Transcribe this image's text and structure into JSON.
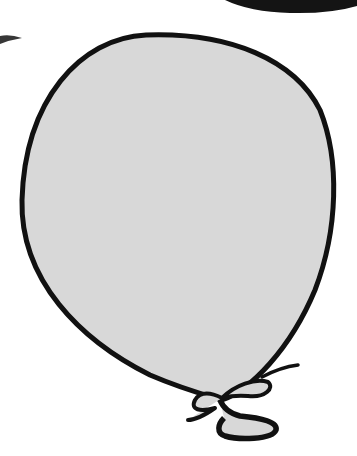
{
  "image": {
    "subject": "balloon",
    "description": "Gray party balloon clipart with black outline and tied knot/bow at bottom",
    "colors": {
      "background": "#ffffff",
      "balloon_fill": "#d8d8d8",
      "outline": "#111111",
      "top_shape": "#141414"
    }
  }
}
